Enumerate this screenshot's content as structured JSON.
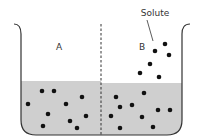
{
  "diagram": {
    "title": "",
    "labels": {
      "compartment_a": "A",
      "compartment_b": "B",
      "solute": "Solute"
    },
    "colors": {
      "liquid": "#cfcfcf",
      "outline": "#333333",
      "particle": "#111111",
      "background": "#ffffff"
    },
    "compartments": [
      {
        "id": "A",
        "particles_in_liquid": 10,
        "particles_above_liquid": 0
      },
      {
        "id": "B",
        "particles_in_liquid": 10,
        "particles_above_liquid": 6
      }
    ],
    "particles": {
      "a_liquid": [
        [
          42,
          91
        ],
        [
          54,
          91
        ],
        [
          28,
          104
        ],
        [
          82,
          97
        ],
        [
          66,
          104
        ],
        [
          48,
          114
        ],
        [
          86,
          116
        ],
        [
          70,
          121
        ],
        [
          43,
          126
        ],
        [
          77,
          128
        ]
      ],
      "b_liquid": [
        [
          116,
          97
        ],
        [
          144,
          93
        ],
        [
          120,
          107
        ],
        [
          132,
          105
        ],
        [
          111,
          116
        ],
        [
          142,
          117
        ],
        [
          158,
          110
        ],
        [
          170,
          110
        ],
        [
          120,
          128
        ],
        [
          153,
          127
        ]
      ],
      "b_above": [
        [
          165,
          44
        ],
        [
          155,
          51
        ],
        [
          169,
          55
        ],
        [
          150,
          64
        ],
        [
          140,
          73
        ],
        [
          159,
          77
        ]
      ]
    }
  }
}
